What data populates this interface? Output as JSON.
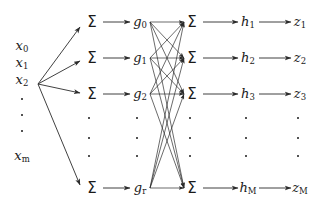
{
  "diagram": {
    "type": "neural-network-schematic",
    "stroke_color": "#2b2b2b",
    "text_color": "#1a1a1a",
    "background": "#ffffff",
    "columns": [
      {
        "name": "inputs",
        "x": 22,
        "kind": "label"
      },
      {
        "name": "hidden-sum",
        "x": 92,
        "kind": "sigma"
      },
      {
        "name": "hidden-act",
        "x": 140,
        "kind": "label"
      },
      {
        "name": "output-sum",
        "x": 192,
        "kind": "sigma"
      },
      {
        "name": "output-act",
        "x": 248,
        "kind": "label"
      },
      {
        "name": "outputs",
        "x": 300,
        "kind": "label"
      }
    ],
    "rows": [
      22,
      58,
      94,
      188
    ],
    "ellipsis_rows": [
      118,
      138,
      156
    ]
  },
  "inputs": {
    "label": "Input vector",
    "nodes": [
      {
        "base": "x",
        "sub": "0",
        "x": 22,
        "y": 46
      },
      {
        "base": "x",
        "sub": "1",
        "x": 22,
        "y": 63
      },
      {
        "base": "x",
        "sub": "2",
        "x": 22,
        "y": 80
      },
      {
        "base": "x",
        "sub": "m",
        "x": 22,
        "y": 156
      }
    ],
    "ellipsis": [
      {
        "x": 22,
        "y": 99
      },
      {
        "x": 22,
        "y": 115
      },
      {
        "x": 22,
        "y": 131
      }
    ]
  },
  "hidden_sum": {
    "label": "Hidden layer summation units",
    "symbol": "Σ",
    "nodes": [
      {
        "x": 92,
        "y": 22
      },
      {
        "x": 92,
        "y": 58
      },
      {
        "x": 92,
        "y": 94
      },
      {
        "x": 92,
        "y": 188
      }
    ],
    "ellipsis": [
      {
        "x": 89,
        "y": 118
      },
      {
        "x": 89,
        "y": 138
      },
      {
        "x": 89,
        "y": 156
      }
    ]
  },
  "hidden_act": {
    "label": "Hidden layer activations",
    "nodes": [
      {
        "base": "g",
        "sub": "0",
        "x": 140,
        "y": 22
      },
      {
        "base": "g",
        "sub": "1",
        "x": 140,
        "y": 58
      },
      {
        "base": "g",
        "sub": "2",
        "x": 140,
        "y": 94
      },
      {
        "base": "g",
        "sub": "r",
        "x": 140,
        "y": 188
      }
    ],
    "ellipsis": [
      {
        "x": 137,
        "y": 118
      },
      {
        "x": 137,
        "y": 138
      },
      {
        "x": 137,
        "y": 156
      }
    ]
  },
  "output_sum": {
    "label": "Output layer summation units",
    "symbol": "Σ",
    "nodes": [
      {
        "x": 192,
        "y": 22
      },
      {
        "x": 192,
        "y": 58
      },
      {
        "x": 192,
        "y": 94
      },
      {
        "x": 192,
        "y": 188
      }
    ],
    "ellipsis": [
      {
        "x": 190,
        "y": 118
      },
      {
        "x": 190,
        "y": 138
      },
      {
        "x": 190,
        "y": 156
      }
    ]
  },
  "output_act": {
    "label": "Output layer activations",
    "nodes": [
      {
        "base": "h",
        "sub": "1",
        "x": 248,
        "y": 22
      },
      {
        "base": "h",
        "sub": "2",
        "x": 248,
        "y": 58
      },
      {
        "base": "h",
        "sub": "3",
        "x": 248,
        "y": 94
      },
      {
        "base": "h",
        "sub": "M",
        "x": 248,
        "y": 188
      }
    ],
    "ellipsis": [
      {
        "x": 246,
        "y": 118
      },
      {
        "x": 246,
        "y": 138
      },
      {
        "x": 246,
        "y": 156
      }
    ]
  },
  "outputs": {
    "label": "Output vector",
    "nodes": [
      {
        "base": "z",
        "sub": "1",
        "x": 300,
        "y": 22
      },
      {
        "base": "z",
        "sub": "2",
        "x": 300,
        "y": 58
      },
      {
        "base": "z",
        "sub": "3",
        "x": 300,
        "y": 94
      },
      {
        "base": "z",
        "sub": "M",
        "x": 300,
        "y": 188
      }
    ],
    "ellipsis": [
      {
        "x": 298,
        "y": 118
      },
      {
        "x": 298,
        "y": 138
      },
      {
        "x": 298,
        "y": 156
      }
    ]
  },
  "edges": {
    "fan_in_origin": {
      "x": 38,
      "y": 84
    },
    "fan_in_targets": [
      {
        "x": 80,
        "y": 27
      },
      {
        "x": 80,
        "y": 61
      },
      {
        "x": 80,
        "y": 93
      },
      {
        "x": 80,
        "y": 185
      }
    ],
    "sum_to_act_rows": [
      22,
      58,
      94,
      188
    ],
    "sum_to_act": {
      "x1": 103,
      "x2": 130
    },
    "mesh_from_x": 150,
    "mesh_to_x": 184,
    "mesh_rows": [
      22,
      58,
      94,
      188
    ],
    "act_to_out_rows": [
      22,
      58,
      94,
      188
    ],
    "act_to_out": {
      "x1": 203,
      "x2": 238
    },
    "out_to_z": {
      "x1": 259,
      "x2": 291
    }
  }
}
